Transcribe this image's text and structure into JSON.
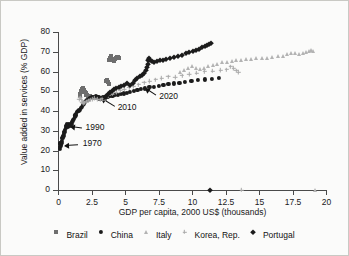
{
  "chart_data": {
    "type": "scatter",
    "title": "",
    "xlabel": "GDP per capita, 2000 US$ (thousands)",
    "ylabel": "Value added in services (% GDP)",
    "xlim": [
      0,
      20
    ],
    "ylim": [
      0,
      80
    ],
    "xticks": [
      0,
      2.5,
      5,
      7.5,
      10,
      12.5,
      15,
      17.5,
      20
    ],
    "xtick_labels": [
      "0",
      "2.5",
      "5",
      "7.5",
      "10",
      "12.5",
      "15",
      "17.5",
      "20"
    ],
    "yticks": [
      0,
      10,
      20,
      30,
      40,
      50,
      60,
      70,
      80
    ],
    "ytick_labels": [
      "0",
      "10",
      "20",
      "30",
      "40",
      "50",
      "60",
      "70",
      "80"
    ],
    "grid": false,
    "legend_position": "bottom",
    "annotations": [
      {
        "label": "1970",
        "text_x": 1.85,
        "text_y": 23.5,
        "point_x": 0.55,
        "point_y": 23.0
      },
      {
        "label": "1990",
        "text_x": 2.05,
        "text_y": 31.5,
        "point_x": 0.95,
        "point_y": 32.5
      },
      {
        "label": "2010",
        "text_x": 4.45,
        "text_y": 41.5,
        "point_x": 3.25,
        "point_y": 46.5
      },
      {
        "label": "2020",
        "text_x": 7.55,
        "text_y": 47.0,
        "point_x": 6.55,
        "point_y": 51.5
      }
    ],
    "series": [
      {
        "name": "Brazil",
        "marker": "square",
        "color": "#6e6e6e",
        "points": [
          [
            1.62,
            47.8
          ],
          [
            1.66,
            48.6
          ],
          [
            1.7,
            49.4
          ],
          [
            1.74,
            50.2
          ],
          [
            1.78,
            51.0
          ],
          [
            1.83,
            51.6
          ],
          [
            1.88,
            51.2
          ],
          [
            1.94,
            50.4
          ],
          [
            2.0,
            49.6
          ],
          [
            2.06,
            48.9
          ],
          [
            2.12,
            48.3
          ],
          [
            2.18,
            48.0
          ],
          [
            2.26,
            47.8
          ],
          [
            2.34,
            47.6
          ],
          [
            2.42,
            47.4
          ],
          [
            2.5,
            47.2
          ],
          [
            2.6,
            47.0
          ],
          [
            2.72,
            46.8
          ],
          [
            2.84,
            46.6
          ],
          [
            2.96,
            46.4
          ],
          [
            3.1,
            46.3
          ],
          [
            3.24,
            46.2
          ],
          [
            3.38,
            46.1
          ],
          [
            3.52,
            46.0
          ],
          [
            3.6,
            55.0
          ],
          [
            3.66,
            55.6
          ],
          [
            3.72,
            54.8
          ],
          [
            3.78,
            53.8
          ],
          [
            3.8,
            66.0
          ],
          [
            3.86,
            67.0
          ],
          [
            3.92,
            67.8
          ],
          [
            3.98,
            67.2
          ],
          [
            4.04,
            66.4
          ],
          [
            4.1,
            65.8
          ],
          [
            4.16,
            65.4
          ],
          [
            4.24,
            66.2
          ],
          [
            4.32,
            67.0
          ],
          [
            4.4,
            67.4
          ],
          [
            4.48,
            67.2
          ],
          [
            4.56,
            67.0
          ]
        ]
      },
      {
        "name": "China",
        "marker": "circle",
        "color": "#1b1b1b",
        "points": [
          [
            0.12,
            21.0
          ],
          [
            0.14,
            22.0
          ],
          [
            0.16,
            23.2
          ],
          [
            0.18,
            24.0
          ],
          [
            0.2,
            23.4
          ],
          [
            0.22,
            22.6
          ],
          [
            0.25,
            23.8
          ],
          [
            0.28,
            25.0
          ],
          [
            0.31,
            26.2
          ],
          [
            0.34,
            27.0
          ],
          [
            0.37,
            26.4
          ],
          [
            0.4,
            27.4
          ],
          [
            0.44,
            28.6
          ],
          [
            0.48,
            29.6
          ],
          [
            0.52,
            30.4
          ],
          [
            0.56,
            31.4
          ],
          [
            0.6,
            32.4
          ],
          [
            0.64,
            33.2
          ],
          [
            0.68,
            32.6
          ],
          [
            0.72,
            31.8
          ],
          [
            0.76,
            32.4
          ],
          [
            0.8,
            33.4
          ],
          [
            0.85,
            33.0
          ],
          [
            0.9,
            32.4
          ],
          [
            0.95,
            32.8
          ],
          [
            1.0,
            33.6
          ],
          [
            1.06,
            34.4
          ],
          [
            1.12,
            35.2
          ],
          [
            1.18,
            36.2
          ],
          [
            1.24,
            37.0
          ],
          [
            1.3,
            37.8
          ],
          [
            1.36,
            38.6
          ],
          [
            1.42,
            39.4
          ],
          [
            1.48,
            40.2
          ],
          [
            1.54,
            40.0
          ],
          [
            1.6,
            40.6
          ],
          [
            1.68,
            41.4
          ],
          [
            1.76,
            42.2
          ],
          [
            1.84,
            43.0
          ],
          [
            1.92,
            43.8
          ],
          [
            2.0,
            44.4
          ],
          [
            2.1,
            45.0
          ],
          [
            2.2,
            45.6
          ],
          [
            2.3,
            46.2
          ],
          [
            2.42,
            46.6
          ],
          [
            2.54,
            47.0
          ],
          [
            2.66,
            47.2
          ],
          [
            2.8,
            47.4
          ],
          [
            2.94,
            47.2
          ],
          [
            3.08,
            46.9
          ],
          [
            3.22,
            46.6
          ],
          [
            3.38,
            46.9
          ],
          [
            3.54,
            47.2
          ],
          [
            3.7,
            47.4
          ],
          [
            3.88,
            47.6
          ],
          [
            4.06,
            47.8
          ],
          [
            4.26,
            48.0
          ],
          [
            4.46,
            48.3
          ],
          [
            4.68,
            48.6
          ],
          [
            4.9,
            48.9
          ],
          [
            5.14,
            49.3
          ],
          [
            5.38,
            49.7
          ],
          [
            5.64,
            50.1
          ],
          [
            5.92,
            50.6
          ],
          [
            6.2,
            51.0
          ],
          [
            6.5,
            51.4
          ],
          [
            6.82,
            52.0
          ],
          [
            7.16,
            52.4
          ],
          [
            7.5,
            52.8
          ],
          [
            7.86,
            53.2
          ],
          [
            8.24,
            53.6
          ],
          [
            8.64,
            54.0
          ],
          [
            9.06,
            54.4
          ],
          [
            9.5,
            54.8
          ],
          [
            9.96,
            55.2
          ],
          [
            10.44,
            55.6
          ],
          [
            10.94,
            56.0
          ],
          [
            11.46,
            56.4
          ],
          [
            12.0,
            56.8
          ]
        ]
      },
      {
        "name": "Italy",
        "marker": "triangle",
        "color": "#b3b3b3",
        "points": [
          [
            9.1,
            60.0
          ],
          [
            9.4,
            61.0
          ],
          [
            9.7,
            62.0
          ],
          [
            10.0,
            62.6
          ],
          [
            10.3,
            62.0
          ],
          [
            10.6,
            61.2
          ],
          [
            10.9,
            61.8
          ],
          [
            11.2,
            62.6
          ],
          [
            11.55,
            63.4
          ],
          [
            11.9,
            64.0
          ],
          [
            12.25,
            64.6
          ],
          [
            12.6,
            65.0
          ],
          [
            12.95,
            65.4
          ],
          [
            13.3,
            65.8
          ],
          [
            13.65,
            66.0
          ],
          [
            14.0,
            66.2
          ],
          [
            14.4,
            66.4
          ],
          [
            14.8,
            66.6
          ],
          [
            15.2,
            66.8
          ],
          [
            15.6,
            67.0
          ],
          [
            16.0,
            67.3
          ],
          [
            16.4,
            67.6
          ],
          [
            16.8,
            68.0
          ],
          [
            17.1,
            69.0
          ],
          [
            17.4,
            69.6
          ],
          [
            17.7,
            69.2
          ],
          [
            18.0,
            68.8
          ],
          [
            18.25,
            69.4
          ],
          [
            18.5,
            70.0
          ],
          [
            18.7,
            70.6
          ],
          [
            18.9,
            71.0
          ],
          [
            19.05,
            70.6
          ]
        ]
      },
      {
        "name": "Korea, Rep.",
        "marker": "plus",
        "color": "#a8a8a8",
        "points": [
          [
            1.6,
            46.0
          ],
          [
            1.66,
            46.8
          ],
          [
            1.72,
            45.6
          ],
          [
            1.8,
            44.4
          ],
          [
            1.9,
            43.8
          ],
          [
            2.0,
            44.2
          ],
          [
            2.12,
            44.8
          ],
          [
            2.26,
            45.2
          ],
          [
            2.42,
            45.6
          ],
          [
            2.58,
            46.0
          ],
          [
            2.76,
            46.4
          ],
          [
            2.94,
            46.0
          ],
          [
            3.14,
            45.6
          ],
          [
            3.34,
            46.2
          ],
          [
            3.56,
            47.0
          ],
          [
            3.8,
            47.8
          ],
          [
            4.06,
            48.6
          ],
          [
            4.34,
            49.4
          ],
          [
            4.64,
            50.2
          ],
          [
            4.96,
            51.0
          ],
          [
            5.3,
            51.8
          ],
          [
            5.66,
            52.6
          ],
          [
            6.04,
            53.4
          ],
          [
            6.44,
            54.2
          ],
          [
            6.86,
            55.0
          ],
          [
            7.3,
            55.8
          ],
          [
            7.76,
            56.6
          ],
          [
            8.24,
            57.4
          ],
          [
            8.74,
            57.0
          ],
          [
            9.26,
            57.8
          ],
          [
            9.8,
            58.6
          ],
          [
            10.36,
            59.2
          ],
          [
            10.94,
            59.8
          ],
          [
            11.54,
            60.2
          ],
          [
            12.16,
            60.6
          ],
          [
            12.6,
            61.0
          ],
          [
            12.9,
            62.4
          ],
          [
            13.1,
            61.6
          ],
          [
            13.3,
            60.4
          ],
          [
            13.5,
            59.6
          ]
        ]
      },
      {
        "name": "Portugal",
        "marker": "diamond",
        "color": "#1b1b1b",
        "points": [
          [
            3.5,
            47.0
          ],
          [
            3.6,
            47.8
          ],
          [
            3.72,
            48.6
          ],
          [
            3.86,
            49.4
          ],
          [
            4.0,
            50.2
          ],
          [
            4.16,
            51.0
          ],
          [
            4.34,
            51.6
          ],
          [
            4.52,
            52.2
          ],
          [
            4.72,
            52.8
          ],
          [
            4.94,
            53.4
          ],
          [
            5.16,
            54.0
          ],
          [
            5.38,
            53.4
          ],
          [
            5.56,
            54.4
          ],
          [
            5.74,
            55.6
          ],
          [
            5.92,
            56.6
          ],
          [
            6.1,
            57.6
          ],
          [
            6.28,
            58.4
          ],
          [
            6.44,
            59.4
          ],
          [
            6.56,
            60.6
          ],
          [
            6.64,
            62.2
          ],
          [
            6.7,
            64.0
          ],
          [
            6.74,
            65.6
          ],
          [
            6.8,
            66.6
          ],
          [
            6.88,
            66.0
          ],
          [
            7.0,
            65.4
          ],
          [
            7.16,
            65.0
          ],
          [
            7.36,
            65.2
          ],
          [
            7.58,
            65.6
          ],
          [
            7.82,
            66.0
          ],
          [
            8.08,
            66.4
          ],
          [
            8.36,
            66.8
          ],
          [
            8.66,
            67.4
          ],
          [
            8.96,
            68.0
          ],
          [
            9.26,
            68.6
          ],
          [
            9.54,
            69.2
          ],
          [
            9.8,
            69.8
          ],
          [
            10.04,
            70.4
          ],
          [
            10.28,
            71.0
          ],
          [
            10.52,
            71.6
          ],
          [
            10.74,
            72.2
          ],
          [
            10.94,
            72.8
          ],
          [
            11.12,
            73.4
          ],
          [
            11.28,
            74.0
          ],
          [
            11.4,
            74.6
          ]
        ]
      }
    ],
    "baseline_markers": [
      {
        "series": "Portugal",
        "marker": "diamond",
        "color": "#1b1b1b",
        "x": 11.35,
        "y": 0
      },
      {
        "series": "Korea, Rep.",
        "marker": "plus",
        "color": "#a8a8a8",
        "x": 13.7,
        "y": 0
      },
      {
        "series": "Italy",
        "marker": "triangle",
        "color": "#b3b3b3",
        "x": 19.15,
        "y": 0
      }
    ]
  },
  "legend": {
    "items": [
      {
        "label": "Brazil",
        "marker": "square",
        "color": "#6e6e6e"
      },
      {
        "label": "China",
        "marker": "circle",
        "color": "#1b1b1b"
      },
      {
        "label": "Italy",
        "marker": "triangle",
        "color": "#b3b3b3"
      },
      {
        "label": "Korea, Rep.",
        "marker": "plus",
        "color": "#a8a8a8"
      },
      {
        "label": "Portugal",
        "marker": "diamond",
        "color": "#1b1b1b"
      }
    ]
  }
}
